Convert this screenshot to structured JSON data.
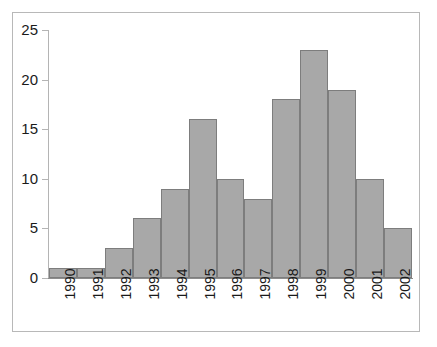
{
  "chart_data": {
    "type": "bar",
    "title": "",
    "subtitle": "",
    "xlabel": "",
    "ylabel": "",
    "categories": [
      "1990",
      "1991",
      "1992",
      "1993",
      "1994",
      "1995",
      "1996",
      "1997",
      "1998",
      "1999",
      "2000",
      "2001",
      "2002"
    ],
    "values": [
      1,
      1,
      3,
      6,
      9,
      16,
      10,
      8,
      18,
      23,
      19,
      10,
      5
    ],
    "ylim": [
      0,
      25
    ],
    "yticks": [
      0,
      5,
      10,
      15,
      20,
      25
    ],
    "ytick_labels": [
      "0",
      "5",
      "10",
      "15",
      "20",
      "25"
    ],
    "grid": false,
    "legend": null,
    "legend_position": "none",
    "bar_fill_color": "#a8a8a8",
    "bar_edge_color": "#7d7d7d",
    "axis_color": "#b4b4b4",
    "frame_color": "#b8b8b8",
    "background_color": "#ffffff",
    "text_color": "#1a1a1a",
    "xtick_label_rotation": "90"
  }
}
